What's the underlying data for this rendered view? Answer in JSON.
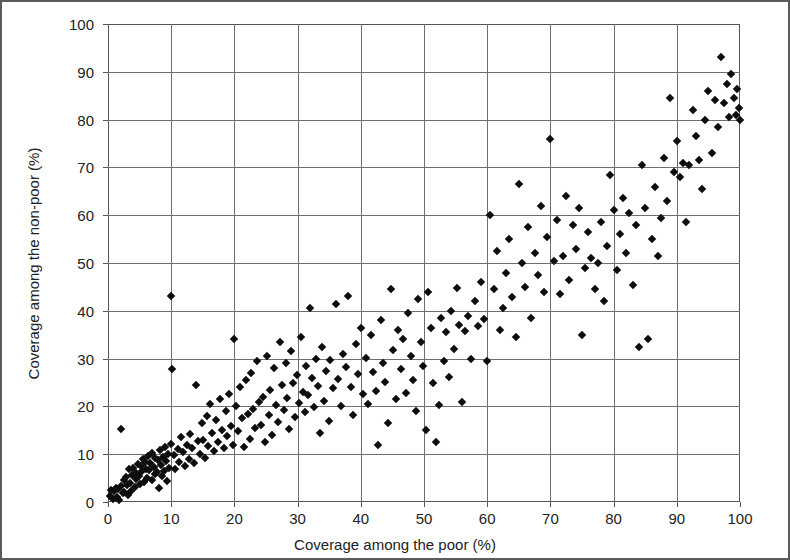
{
  "chart_data": {
    "type": "scatter",
    "title": "",
    "xlabel": "Coverage among the poor (%)",
    "ylabel": "Coverage among the non-poor (%)",
    "xlim": [
      0,
      100
    ],
    "ylim": [
      0,
      100
    ],
    "xticks": [
      0,
      10,
      20,
      30,
      40,
      50,
      60,
      70,
      80,
      90,
      100
    ],
    "yticks": [
      0,
      10,
      20,
      30,
      40,
      50,
      60,
      70,
      80,
      90,
      100
    ],
    "xtick_labels": [
      "0",
      "10",
      "20",
      "30",
      "40",
      "50",
      "60",
      "70",
      "80",
      "90",
      "100"
    ],
    "ytick_labels": [
      "0",
      "10",
      "20",
      "30",
      "40",
      "50",
      "60",
      "70",
      "80",
      "90",
      "100"
    ],
    "grid": true,
    "legend": null,
    "marker": "diamond",
    "marker_color": "#0d0d0d",
    "marker_size": 6,
    "n_points": 258,
    "points": [
      [
        0.3,
        1.2
      ],
      [
        0.5,
        2.5
      ],
      [
        0.8,
        0.6
      ],
      [
        1.0,
        2.2
      ],
      [
        1.2,
        3.0
      ],
      [
        1.4,
        1.0
      ],
      [
        1.6,
        2.8
      ],
      [
        1.8,
        0.5
      ],
      [
        2.0,
        15.3
      ],
      [
        2.1,
        3.4
      ],
      [
        2.3,
        1.8
      ],
      [
        2.5,
        4.5
      ],
      [
        2.6,
        2.0
      ],
      [
        2.8,
        5.2
      ],
      [
        3.0,
        3.6
      ],
      [
        3.1,
        1.4
      ],
      [
        3.3,
        6.8
      ],
      [
        3.5,
        4.0
      ],
      [
        3.6,
        2.4
      ],
      [
        3.8,
        5.6
      ],
      [
        4.0,
        7.2
      ],
      [
        4.2,
        3.2
      ],
      [
        4.4,
        6.0
      ],
      [
        4.5,
        4.8
      ],
      [
        4.7,
        8.0
      ],
      [
        4.9,
        5.4
      ],
      [
        5.0,
        3.8
      ],
      [
        5.2,
        7.6
      ],
      [
        5.4,
        6.4
      ],
      [
        5.6,
        9.0
      ],
      [
        5.7,
        4.2
      ],
      [
        5.9,
        8.4
      ],
      [
        6.0,
        7.0
      ],
      [
        6.2,
        5.0
      ],
      [
        6.4,
        9.6
      ],
      [
        6.5,
        6.6
      ],
      [
        6.7,
        8.2
      ],
      [
        6.9,
        4.6
      ],
      [
        7.0,
        10.2
      ],
      [
        7.2,
        7.4
      ],
      [
        7.4,
        5.8
      ],
      [
        7.5,
        9.2
      ],
      [
        7.7,
        6.2
      ],
      [
        7.9,
        8.8
      ],
      [
        8.0,
        3.0
      ],
      [
        8.2,
        10.8
      ],
      [
        8.4,
        7.8
      ],
      [
        8.5,
        5.5
      ],
      [
        8.7,
        9.4
      ],
      [
        8.9,
        6.5
      ],
      [
        9.0,
        11.5
      ],
      [
        9.2,
        8.6
      ],
      [
        9.4,
        4.4
      ],
      [
        9.5,
        10.0
      ],
      [
        9.7,
        7.1
      ],
      [
        9.9,
        12.2
      ],
      [
        10.0,
        43.0
      ],
      [
        10.2,
        27.8
      ],
      [
        10.4,
        9.8
      ],
      [
        10.6,
        6.9
      ],
      [
        11.0,
        11.0
      ],
      [
        11.3,
        8.3
      ],
      [
        11.6,
        13.5
      ],
      [
        11.9,
        10.5
      ],
      [
        12.2,
        7.5
      ],
      [
        12.5,
        12.0
      ],
      [
        12.8,
        9.1
      ],
      [
        13.0,
        14.2
      ],
      [
        13.3,
        11.2
      ],
      [
        13.6,
        8.1
      ],
      [
        13.9,
        24.5
      ],
      [
        14.2,
        12.8
      ],
      [
        14.5,
        10.1
      ],
      [
        14.8,
        16.5
      ],
      [
        15.0,
        13.0
      ],
      [
        15.3,
        9.3
      ],
      [
        15.6,
        18.0
      ],
      [
        15.9,
        11.8
      ],
      [
        16.2,
        20.5
      ],
      [
        16.5,
        14.5
      ],
      [
        16.8,
        10.7
      ],
      [
        17.1,
        17.2
      ],
      [
        17.4,
        12.5
      ],
      [
        17.7,
        21.5
      ],
      [
        18.0,
        15.0
      ],
      [
        18.3,
        11.3
      ],
      [
        18.6,
        19.0
      ],
      [
        18.9,
        13.8
      ],
      [
        19.2,
        22.5
      ],
      [
        19.5,
        16.0
      ],
      [
        19.8,
        12.0
      ],
      [
        20.0,
        34.0
      ],
      [
        20.3,
        20.0
      ],
      [
        20.6,
        14.8
      ],
      [
        20.9,
        24.0
      ],
      [
        21.2,
        17.5
      ],
      [
        21.5,
        11.6
      ],
      [
        21.8,
        25.5
      ],
      [
        22.1,
        18.5
      ],
      [
        22.4,
        13.2
      ],
      [
        22.7,
        27.0
      ],
      [
        23.0,
        19.5
      ],
      [
        23.3,
        15.5
      ],
      [
        23.6,
        29.5
      ],
      [
        23.9,
        21.0
      ],
      [
        24.2,
        16.2
      ],
      [
        24.5,
        22.0
      ],
      [
        24.8,
        12.6
      ],
      [
        25.1,
        30.5
      ],
      [
        25.4,
        18.2
      ],
      [
        25.7,
        23.5
      ],
      [
        26.0,
        14.0
      ],
      [
        26.3,
        28.0
      ],
      [
        26.6,
        20.2
      ],
      [
        26.9,
        16.8
      ],
      [
        27.2,
        33.5
      ],
      [
        27.5,
        24.5
      ],
      [
        27.8,
        19.2
      ],
      [
        28.1,
        29.0
      ],
      [
        28.4,
        21.8
      ],
      [
        28.7,
        15.2
      ],
      [
        29.0,
        31.5
      ],
      [
        29.3,
        25.0
      ],
      [
        29.6,
        17.8
      ],
      [
        29.9,
        26.5
      ],
      [
        30.2,
        20.8
      ],
      [
        30.5,
        34.5
      ],
      [
        30.8,
        23.0
      ],
      [
        31.1,
        18.8
      ],
      [
        31.4,
        28.5
      ],
      [
        31.7,
        22.4
      ],
      [
        32.0,
        40.5
      ],
      [
        32.3,
        26.0
      ],
      [
        32.6,
        19.8
      ],
      [
        32.9,
        30.0
      ],
      [
        33.2,
        24.2
      ],
      [
        33.5,
        14.5
      ],
      [
        33.8,
        32.5
      ],
      [
        34.1,
        21.2
      ],
      [
        34.5,
        27.5
      ],
      [
        34.9,
        17.0
      ],
      [
        35.2,
        29.8
      ],
      [
        35.6,
        23.8
      ],
      [
        36.0,
        41.5
      ],
      [
        36.4,
        25.8
      ],
      [
        36.8,
        20.0
      ],
      [
        37.2,
        31.0
      ],
      [
        37.6,
        28.2
      ],
      [
        38.0,
        43.0
      ],
      [
        38.4,
        24.0
      ],
      [
        38.8,
        18.2
      ],
      [
        39.2,
        33.0
      ],
      [
        39.6,
        26.8
      ],
      [
        40.0,
        36.5
      ],
      [
        40.4,
        22.6
      ],
      [
        40.8,
        30.2
      ],
      [
        41.2,
        20.5
      ],
      [
        41.6,
        35.0
      ],
      [
        42.0,
        27.2
      ],
      [
        42.4,
        23.2
      ],
      [
        42.8,
        12.0
      ],
      [
        43.2,
        38.0
      ],
      [
        43.5,
        29.0
      ],
      [
        43.9,
        25.2
      ],
      [
        44.3,
        16.5
      ],
      [
        44.7,
        44.5
      ],
      [
        45.1,
        31.8
      ],
      [
        45.5,
        21.5
      ],
      [
        45.9,
        36.0
      ],
      [
        46.3,
        27.8
      ],
      [
        46.7,
        34.0
      ],
      [
        47.1,
        22.8
      ],
      [
        47.5,
        39.5
      ],
      [
        47.9,
        30.5
      ],
      [
        48.3,
        25.5
      ],
      [
        48.7,
        19.0
      ],
      [
        49.1,
        42.5
      ],
      [
        49.5,
        33.5
      ],
      [
        49.9,
        28.5
      ],
      [
        50.3,
        15.0
      ],
      [
        50.7,
        44.0
      ],
      [
        51.1,
        36.5
      ],
      [
        51.5,
        24.8
      ],
      [
        51.9,
        12.5
      ],
      [
        52.3,
        20.2
      ],
      [
        52.7,
        38.5
      ],
      [
        53.1,
        29.5
      ],
      [
        53.5,
        35.5
      ],
      [
        53.9,
        26.2
      ],
      [
        54.3,
        40.0
      ],
      [
        54.8,
        32.0
      ],
      [
        55.2,
        44.8
      ],
      [
        55.6,
        37.0
      ],
      [
        56.0,
        21.0
      ],
      [
        56.5,
        35.8
      ],
      [
        57.0,
        39.0
      ],
      [
        57.5,
        30.0
      ],
      [
        58.0,
        42.0
      ],
      [
        58.5,
        36.8
      ],
      [
        59.0,
        46.0
      ],
      [
        59.5,
        38.2
      ],
      [
        60.0,
        29.5
      ],
      [
        60.5,
        60.0
      ],
      [
        61.0,
        44.5
      ],
      [
        61.5,
        52.5
      ],
      [
        62.0,
        36.0
      ],
      [
        62.5,
        40.5
      ],
      [
        63.0,
        48.0
      ],
      [
        63.5,
        55.0
      ],
      [
        64.0,
        42.8
      ],
      [
        64.5,
        34.5
      ],
      [
        65.0,
        66.5
      ],
      [
        65.5,
        50.0
      ],
      [
        66.0,
        45.0
      ],
      [
        66.5,
        57.5
      ],
      [
        67.0,
        38.5
      ],
      [
        67.5,
        52.0
      ],
      [
        68.0,
        47.5
      ],
      [
        68.5,
        62.0
      ],
      [
        69.0,
        44.0
      ],
      [
        69.5,
        55.5
      ],
      [
        70.0,
        76.0
      ],
      [
        70.5,
        50.5
      ],
      [
        71.0,
        59.0
      ],
      [
        71.5,
        43.5
      ],
      [
        72.0,
        51.5
      ],
      [
        72.5,
        64.0
      ],
      [
        73.0,
        46.5
      ],
      [
        73.5,
        58.0
      ],
      [
        74.0,
        53.0
      ],
      [
        74.5,
        61.5
      ],
      [
        75.0,
        35.0
      ],
      [
        75.5,
        49.0
      ],
      [
        76.0,
        56.5
      ],
      [
        76.5,
        51.0
      ],
      [
        77.0,
        44.5
      ],
      [
        77.5,
        50.0
      ],
      [
        78.0,
        58.5
      ],
      [
        78.5,
        42.0
      ],
      [
        79.0,
        53.5
      ],
      [
        79.5,
        68.5
      ],
      [
        80.0,
        61.0
      ],
      [
        80.5,
        48.5
      ],
      [
        81.0,
        56.0
      ],
      [
        81.5,
        63.5
      ],
      [
        82.0,
        52.0
      ],
      [
        82.5,
        60.5
      ],
      [
        83.0,
        45.5
      ],
      [
        83.5,
        58.0
      ],
      [
        84.0,
        32.5
      ],
      [
        84.5,
        70.5
      ],
      [
        85.0,
        61.5
      ],
      [
        85.5,
        34.0
      ],
      [
        86.0,
        55.0
      ],
      [
        86.5,
        66.0
      ],
      [
        87.0,
        51.5
      ],
      [
        87.5,
        59.5
      ],
      [
        88.0,
        72.0
      ],
      [
        88.5,
        63.0
      ],
      [
        89.0,
        84.5
      ],
      [
        89.5,
        69.0
      ],
      [
        90.0,
        75.5
      ],
      [
        90.5,
        68.0
      ],
      [
        91.0,
        71.0
      ],
      [
        91.5,
        58.5
      ],
      [
        92.0,
        70.5
      ],
      [
        92.5,
        82.0
      ],
      [
        93.0,
        76.5
      ],
      [
        93.5,
        71.5
      ],
      [
        94.0,
        65.5
      ],
      [
        94.5,
        80.0
      ],
      [
        95.0,
        86.0
      ],
      [
        95.5,
        73.0
      ],
      [
        96.0,
        84.0
      ],
      [
        96.5,
        78.5
      ],
      [
        97.0,
        93.0
      ],
      [
        97.5,
        83.5
      ],
      [
        98.0,
        87.5
      ],
      [
        98.3,
        80.5
      ],
      [
        98.6,
        89.5
      ],
      [
        99.0,
        84.5
      ],
      [
        99.3,
        81.0
      ],
      [
        99.6,
        86.5
      ],
      [
        99.8,
        82.5
      ],
      [
        100.0,
        80.0
      ]
    ]
  }
}
